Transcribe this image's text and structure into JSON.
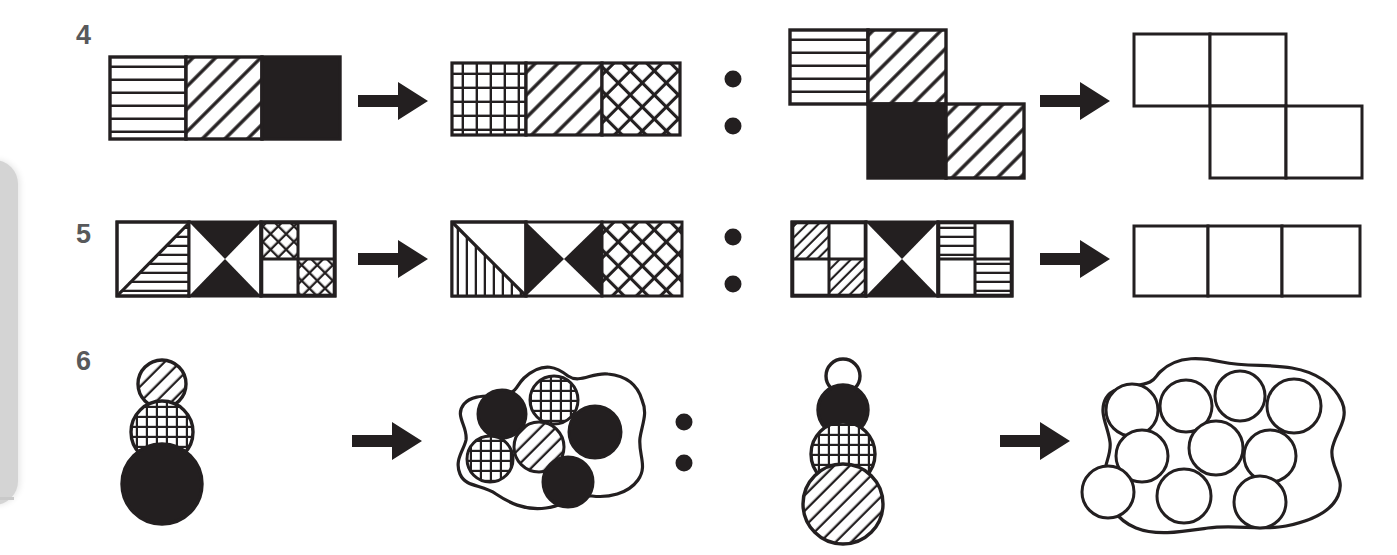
{
  "page": {
    "background": "#ffffff",
    "ink": "#231f20",
    "number_color": "#58595b",
    "width": 1397,
    "height": 555
  },
  "edge_artifact": {
    "name": "page-edge-shadow",
    "color": "#d4d4d4"
  },
  "separators": {
    "arrow_glyph": "→",
    "ratio_glyph": ":",
    "arrow_label": "transforms-into",
    "ratio_label": "is-to"
  },
  "rows": [
    {
      "number": "4",
      "left_analogy": {
        "source": {
          "shape": "horizontal-bar-3-cells",
          "cells": [
            {
              "fill": "horizontal-lines"
            },
            {
              "fill": "diagonal-lines-up"
            },
            {
              "fill": "solid-black"
            }
          ]
        },
        "target": {
          "shape": "horizontal-bar-3-cells",
          "cells": [
            {
              "fill": "grid"
            },
            {
              "fill": "diagonal-lines-up"
            },
            {
              "fill": "crosshatch"
            }
          ]
        }
      },
      "right_analogy": {
        "source": {
          "shape": "z-tetromino-4-squares",
          "cells": [
            {
              "position": "top-left",
              "fill": "horizontal-lines"
            },
            {
              "position": "top-right",
              "fill": "diagonal-lines-up"
            },
            {
              "position": "bottom-left",
              "fill": "solid-black"
            },
            {
              "position": "bottom-right",
              "fill": "diagonal-lines-up"
            }
          ]
        },
        "target": {
          "shape": "z-tetromino-4-squares",
          "cells": [
            {
              "position": "top-left",
              "fill": "empty"
            },
            {
              "position": "top-right",
              "fill": "empty"
            },
            {
              "position": "bottom-left",
              "fill": "empty"
            },
            {
              "position": "bottom-right",
              "fill": "empty"
            }
          ],
          "is_answer_blank": true
        }
      }
    },
    {
      "number": "5",
      "left_analogy": {
        "source": {
          "shape": "horizontal-bar-3-cells",
          "cells": [
            {
              "fill": "diagonal-split-horizontal-lines-lower"
            },
            {
              "fill": "bowtie-vertical-black"
            },
            {
              "fill": "quad-crosshatch-diagonal"
            }
          ]
        },
        "target": {
          "shape": "horizontal-bar-3-cells",
          "cells": [
            {
              "fill": "diagonal-split-vertical-lines-lower"
            },
            {
              "fill": "bowtie-horizontal-black"
            },
            {
              "fill": "crosshatch"
            }
          ]
        }
      },
      "right_analogy": {
        "source": {
          "shape": "horizontal-bar-3-cells",
          "cells": [
            {
              "fill": "quad-diagonal-lines-diagonal"
            },
            {
              "fill": "bowtie-vertical-black"
            },
            {
              "fill": "quad-horizontal-lines-diagonal"
            }
          ]
        },
        "target": {
          "shape": "horizontal-bar-3-cells",
          "cells": [
            {
              "fill": "empty"
            },
            {
              "fill": "empty"
            },
            {
              "fill": "empty"
            }
          ],
          "is_answer_blank": true
        }
      }
    },
    {
      "number": "6",
      "left_analogy": {
        "source": {
          "shape": "stacked-circles",
          "circles": [
            {
              "size": "small",
              "fill": "diagonal-lines-up"
            },
            {
              "size": "medium",
              "fill": "grid"
            },
            {
              "size": "large",
              "fill": "solid-black"
            }
          ]
        },
        "target": {
          "shape": "blob-with-circles",
          "circles": [
            {
              "fill": "solid-black"
            },
            {
              "fill": "grid"
            },
            {
              "fill": "solid-black"
            },
            {
              "fill": "grid"
            },
            {
              "fill": "diagonal-lines-up"
            },
            {
              "fill": "solid-black"
            }
          ],
          "count": 6
        }
      },
      "right_analogy": {
        "source": {
          "shape": "stacked-circles",
          "circles": [
            {
              "size": "small",
              "fill": "empty"
            },
            {
              "size": "medium",
              "fill": "solid-black"
            },
            {
              "size": "medium-large",
              "fill": "grid"
            },
            {
              "size": "large",
              "fill": "diagonal-lines-up"
            }
          ]
        },
        "target": {
          "shape": "blob-with-circles",
          "circles": [
            {
              "fill": "empty"
            },
            {
              "fill": "empty"
            },
            {
              "fill": "empty"
            },
            {
              "fill": "empty"
            },
            {
              "fill": "empty"
            },
            {
              "fill": "empty"
            },
            {
              "fill": "empty"
            },
            {
              "fill": "empty"
            },
            {
              "fill": "empty"
            },
            {
              "fill": "empty"
            }
          ],
          "count": 10,
          "is_answer_blank": true
        }
      }
    }
  ]
}
